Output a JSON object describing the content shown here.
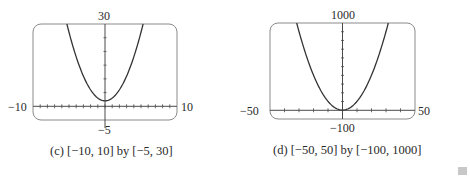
{
  "chart_data": [
    {
      "type": "line",
      "title": "(c) [−10, 10] by [−5, 30]",
      "function": "y = x^2 + 2",
      "xlim": [
        -10,
        10
      ],
      "ylim": [
        -5,
        30
      ],
      "x_tick_spacing": 1,
      "y_tick_spacing": 5,
      "grid": false,
      "axis_labels": {
        "left": "−10",
        "right": "10",
        "top": "30",
        "bottom": "−5"
      },
      "x": [
        -5.3,
        -4,
        -3,
        -2,
        -1,
        0,
        1,
        2,
        3,
        4,
        5.3
      ],
      "y": [
        30,
        18,
        11,
        6,
        3,
        2,
        3,
        6,
        11,
        18,
        30
      ]
    },
    {
      "type": "line",
      "title": "(d) [−50, 50] by [−100, 1000]",
      "function": "y = x^2 + 2",
      "xlim": [
        -50,
        50
      ],
      "ylim": [
        -100,
        1000
      ],
      "x_tick_spacing": 10,
      "y_tick_spacing": 100,
      "grid": false,
      "axis_labels": {
        "left": "−50",
        "right": "50",
        "top": "1000",
        "bottom": "−100"
      },
      "x": [
        -31.6,
        -30,
        -20,
        -10,
        0,
        10,
        20,
        30,
        31.6
      ],
      "y": [
        1000,
        902,
        402,
        102,
        2,
        102,
        402,
        902,
        1000
      ]
    }
  ],
  "panels": {
    "c": {
      "caption": "(c) [−10, 10] by [−5, 30]",
      "xmin_label": "−10",
      "xmax_label": "10",
      "ymax_label": "30",
      "ymin_label": "−5"
    },
    "d": {
      "caption": "(d) [−50, 50] by [−100, 1000]",
      "xmin_label": "−50",
      "xmax_label": "50",
      "ymax_label": "1000",
      "ymin_label": "−100"
    }
  },
  "colors": {
    "curve": "#3a3a3a",
    "frame": "#7a7a7a",
    "axis": "#4a4a4a"
  }
}
